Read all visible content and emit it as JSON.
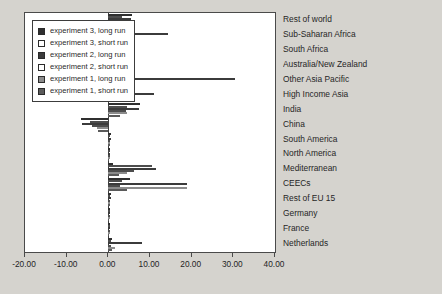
{
  "chart_data": {
    "type": "bar",
    "orientation": "horizontal",
    "title": "",
    "xlabel": "",
    "ylabel": "",
    "xlim": [
      -20,
      40
    ],
    "xticks": [
      -20,
      10,
      0,
      10,
      20,
      30,
      40
    ],
    "xtick_labels": [
      "-20.00",
      "-10.00",
      "0.00",
      "10.00",
      "20.00",
      "30.00",
      "40.00"
    ],
    "grid": false,
    "legend_position": "top-left",
    "categories": [
      "Rest of world",
      "Sub-Saharan Africa",
      "South Africa",
      "Australia/New Zealand",
      "Other Asia Pacific",
      "High Income Asia",
      "India",
      "China",
      "South America",
      "North America",
      "Mediterranean",
      "CEECs",
      "Rest of EU 15",
      "Germany",
      "France",
      "Netherlands"
    ],
    "series": [
      {
        "name": "experiment 3, long run",
        "color": "#2f2f2f",
        "values": [
          5.6,
          3.1,
          1.4,
          6.1,
          2.3,
          2.0,
          7.5,
          -6.6,
          0.6,
          0.5,
          1.2,
          5.1,
          0.6,
          0.4,
          0.5,
          1.0
        ]
      },
      {
        "name": "experiment 3, short run",
        "color": "#ffffff",
        "values": [
          3.4,
          2.1,
          1.0,
          2.6,
          1.4,
          1.3,
          4.6,
          -4.3,
          0.4,
          0.3,
          10.6,
          3.2,
          0.4,
          0.3,
          0.3,
          0.7
        ]
      },
      {
        "name": "experiment 2, long run",
        "color": "#3b3b3b",
        "values": [
          5.4,
          14.4,
          1.3,
          5.8,
          30.4,
          11.0,
          7.3,
          -6.4,
          0.6,
          0.5,
          11.4,
          19.0,
          0.6,
          0.4,
          0.5,
          8.0
        ]
      },
      {
        "name": "experiment 2, short run",
        "color": "#ffffff",
        "values": [
          2.6,
          1.7,
          0.9,
          2.4,
          1.2,
          1.1,
          4.2,
          -3.9,
          0.3,
          0.3,
          6.2,
          2.8,
          0.3,
          0.2,
          0.3,
          0.6
        ]
      },
      {
        "name": "experiment 1, long run",
        "color": "#8c8c8c",
        "values": [
          1.8,
          5.7,
          0.8,
          1.6,
          2.0,
          1.7,
          4.4,
          -2.8,
          0.4,
          0.3,
          4.5,
          18.9,
          0.4,
          0.3,
          0.3,
          1.6
        ]
      },
      {
        "name": "experiment 1, short run",
        "color": "#5a5a5a",
        "values": [
          1.2,
          3.4,
          0.6,
          1.1,
          1.3,
          1.1,
          2.7,
          -2.5,
          0.3,
          0.2,
          2.6,
          4.4,
          0.3,
          0.2,
          0.2,
          1.0
        ]
      }
    ]
  },
  "legend": {
    "items": [
      {
        "label": "experiment 3, long run",
        "swatch": "#2f2f2f"
      },
      {
        "label": "experiment 3, short run",
        "swatch": "#ffffff"
      },
      {
        "label": "experiment 2, long run",
        "swatch": "#3b3b3b"
      },
      {
        "label": "experiment 2, short run",
        "swatch": "#ffffff"
      },
      {
        "label": "experiment 1, long run",
        "swatch": "#8c8c8c"
      },
      {
        "label": "experiment 1, short run",
        "swatch": "#5a5a5a"
      }
    ]
  },
  "colors": {
    "page_background": "#d5d3ce",
    "plot_background": "#ffffff",
    "axis": "#4a4a4a",
    "text": "#262626"
  }
}
